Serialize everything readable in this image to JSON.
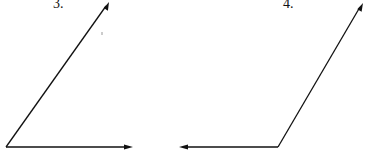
{
  "figures": [
    {
      "label": "3.",
      "vertex": [
        6,
        147
      ],
      "rays": [
        {
          "direction": "right",
          "tip": [
            133,
            147
          ]
        },
        {
          "direction": "up-right",
          "tip": [
            109,
            2
          ]
        }
      ]
    },
    {
      "label": "4.",
      "vertex": [
        278,
        147
      ],
      "rays": [
        {
          "direction": "left",
          "tip": [
            179,
            147
          ]
        },
        {
          "direction": "up-right",
          "tip": [
            363,
            3
          ]
        }
      ]
    }
  ],
  "colors": {
    "line": "#111111",
    "background": "#ffffff"
  }
}
